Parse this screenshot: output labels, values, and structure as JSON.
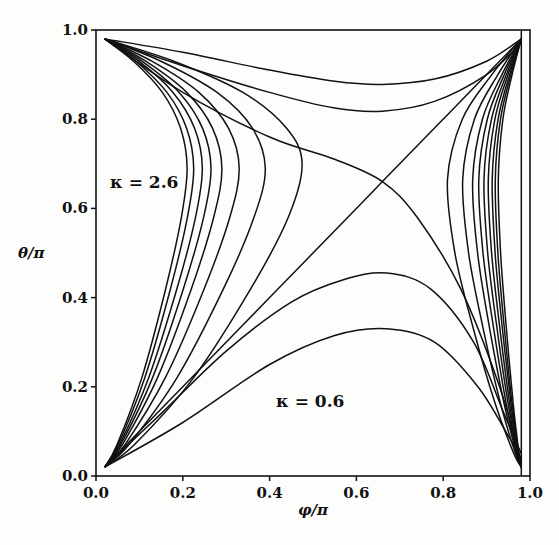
{
  "chart_data": {
    "type": "line",
    "title": "",
    "xlabel": "φ/π",
    "ylabel": "θ/π",
    "xlim": [
      0.0,
      1.0
    ],
    "ylim": [
      0.0,
      1.0
    ],
    "xticks": [
      "0.0",
      "0.2",
      "0.4",
      "0.6",
      "0.8",
      "1.0"
    ],
    "xtick_values": [
      0.0,
      0.2,
      0.4,
      0.6,
      0.8,
      1.0
    ],
    "yticks": [
      "0.0",
      "0.2",
      "0.4",
      "0.6",
      "0.8",
      "1.0"
    ],
    "ytick_values": [
      0.0,
      0.2,
      0.4,
      0.6,
      0.8,
      1.0
    ],
    "grid": false,
    "legend": "none",
    "annotations": [
      {
        "text": "κ = 2.6",
        "x": 0.06,
        "y": 0.69
      },
      {
        "text": "κ = 0.6",
        "x": 0.42,
        "y": 0.175
      }
    ],
    "series": [
      {
        "name": "bottom-1",
        "points": [
          [
            0.02,
            0.02
          ],
          [
            0.2,
            0.12
          ],
          [
            0.4,
            0.25
          ],
          [
            0.55,
            0.315
          ],
          [
            0.67,
            0.33
          ],
          [
            0.78,
            0.3
          ],
          [
            0.88,
            0.2
          ],
          [
            0.95,
            0.09
          ],
          [
            0.98,
            0.04
          ]
        ]
      },
      {
        "name": "bottom-2",
        "points": [
          [
            0.02,
            0.02
          ],
          [
            0.15,
            0.14
          ],
          [
            0.3,
            0.28
          ],
          [
            0.45,
            0.39
          ],
          [
            0.57,
            0.44
          ],
          [
            0.67,
            0.455
          ],
          [
            0.77,
            0.42
          ],
          [
            0.87,
            0.3
          ],
          [
            0.94,
            0.14
          ],
          [
            0.98,
            0.05
          ]
        ]
      },
      {
        "name": "separatrix-a",
        "points": [
          [
            0.02,
            0.02
          ],
          [
            0.2,
            0.2
          ],
          [
            0.4,
            0.4
          ],
          [
            0.6,
            0.6
          ],
          [
            0.66,
            0.66
          ],
          [
            0.8,
            0.8
          ],
          [
            0.98,
            0.98
          ]
        ]
      },
      {
        "name": "separatrix-b",
        "points": [
          [
            0.02,
            0.98
          ],
          [
            0.2,
            0.86
          ],
          [
            0.4,
            0.76
          ],
          [
            0.55,
            0.71
          ],
          [
            0.66,
            0.66
          ],
          [
            0.74,
            0.58
          ],
          [
            0.84,
            0.42
          ],
          [
            0.93,
            0.2
          ],
          [
            0.98,
            0.03
          ]
        ]
      },
      {
        "name": "top-1",
        "points": [
          [
            0.02,
            0.98
          ],
          [
            0.2,
            0.95
          ],
          [
            0.4,
            0.91
          ],
          [
            0.55,
            0.885
          ],
          [
            0.66,
            0.878
          ],
          [
            0.78,
            0.89
          ],
          [
            0.9,
            0.93
          ],
          [
            0.98,
            0.98
          ]
        ]
      },
      {
        "name": "top-2",
        "points": [
          [
            0.02,
            0.98
          ],
          [
            0.2,
            0.92
          ],
          [
            0.4,
            0.86
          ],
          [
            0.55,
            0.825
          ],
          [
            0.66,
            0.818
          ],
          [
            0.78,
            0.84
          ],
          [
            0.9,
            0.9
          ],
          [
            0.98,
            0.97
          ]
        ]
      },
      {
        "name": "left-1",
        "tip": [
          0.21,
          0.69
        ]
      },
      {
        "name": "left-2",
        "tip": [
          0.225,
          0.69
        ]
      },
      {
        "name": "left-3",
        "tip": [
          0.245,
          0.69
        ]
      },
      {
        "name": "left-4",
        "tip": [
          0.265,
          0.69
        ]
      },
      {
        "name": "left-5",
        "tip": [
          0.29,
          0.69
        ]
      },
      {
        "name": "left-6",
        "tip": [
          0.33,
          0.69
        ]
      },
      {
        "name": "left-7",
        "tip": [
          0.39,
          0.69
        ]
      },
      {
        "name": "left-8",
        "tip": [
          0.475,
          0.7
        ]
      },
      {
        "name": "right-1",
        "tip": [
          0.81,
          0.665
        ]
      },
      {
        "name": "right-2",
        "tip": [
          0.845,
          0.665
        ]
      },
      {
        "name": "right-3",
        "tip": [
          0.868,
          0.665
        ]
      },
      {
        "name": "right-4",
        "tip": [
          0.882,
          0.665
        ]
      },
      {
        "name": "right-5",
        "tip": [
          0.894,
          0.665
        ]
      },
      {
        "name": "right-6",
        "tip": [
          0.904,
          0.665
        ]
      },
      {
        "name": "right-7",
        "tip": [
          0.913,
          0.665
        ]
      },
      {
        "name": "right-8",
        "tip": [
          0.92,
          0.665
        ]
      },
      {
        "name": "right-9",
        "tip": [
          0.927,
          0.665
        ]
      }
    ]
  }
}
